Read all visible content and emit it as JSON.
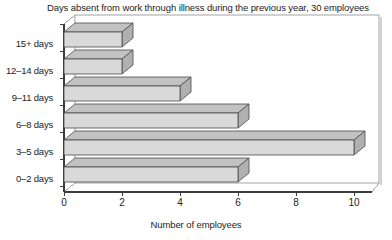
{
  "chart_data": {
    "type": "bar",
    "orientation": "horizontal",
    "title": "Days absent from work through illness during the previous year, 30 employees",
    "xlabel": "Number of employees",
    "ylabel": "",
    "categories": [
      "0–2 days",
      "3–5 days",
      "6–8 days",
      "9–11 days",
      "12–14 days",
      "15+ days"
    ],
    "values": [
      6,
      10,
      6,
      4,
      2,
      2
    ],
    "xlim": [
      0,
      10
    ],
    "xticks": [
      0,
      2,
      4,
      6,
      8,
      10
    ],
    "xtick_labels": [
      "0",
      "2",
      "4",
      "6",
      "8",
      "10"
    ],
    "grid": false,
    "legend": false,
    "style": "3d-bars",
    "colors": {
      "bar_front": "#d9d9d9",
      "bar_top": "#c2c2c2",
      "bar_side": "#b0b0b0",
      "bar_edge": "#4a4a4a",
      "axis": "#3c3c3c",
      "frame": "#8c8c8c",
      "text": "#1d1d1d",
      "background": "#ffffff"
    }
  },
  "axes": {
    "y_category_labels": [
      "15+ days",
      "12–14 days",
      "9–11 days",
      "6–8 days",
      "3–5 days",
      "0–2 days"
    ],
    "x_tick_labels": [
      "0",
      "2",
      "4",
      "6",
      "8",
      "10"
    ],
    "x_axis_title": "Number of employees"
  }
}
